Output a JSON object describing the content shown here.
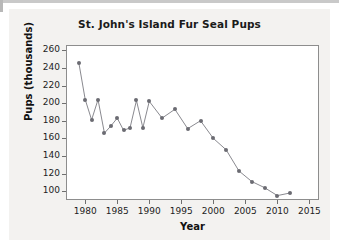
{
  "figure": {
    "background_color": "#f3f2f0",
    "plot_background_color": "#ffffff",
    "axis_color": "#8d8d8d",
    "series_color": "#6b6b72"
  },
  "chart_data": {
    "type": "line",
    "title": "St. John's Island Fur Seal Pups",
    "xlabel": "Year",
    "ylabel": "Pups (thousands)",
    "xlim": [
      1977,
      2016.5
    ],
    "ylim": [
      90,
      266
    ],
    "grid": false,
    "legend": null,
    "xticks": [
      1980,
      1985,
      1990,
      1995,
      2000,
      2005,
      2010,
      2015
    ],
    "xtick_labels": [
      "1980",
      "1985",
      "1990",
      "1995",
      "2000",
      "2005",
      "2010",
      "2015"
    ],
    "yticks": [
      100,
      120,
      140,
      160,
      180,
      200,
      220,
      240,
      260
    ],
    "ytick_labels": [
      "100",
      "120",
      "140",
      "160",
      "180",
      "200",
      "220",
      "240",
      "260"
    ],
    "marker": "circle",
    "x": [
      1979,
      1980,
      1981,
      1982,
      1983,
      1984,
      1985,
      1986,
      1987,
      1988,
      1989,
      1990,
      1992,
      1994,
      1996,
      1998,
      2000,
      2002,
      2004,
      2006,
      2008,
      2010,
      2012
    ],
    "values": [
      246,
      204,
      181,
      204,
      166,
      174,
      183,
      169,
      172,
      203,
      172,
      202,
      183,
      193,
      171,
      180,
      160,
      147,
      123,
      111,
      104,
      95,
      98
    ],
    "points": [
      {
        "year": 1979,
        "pups": 246
      },
      {
        "year": 1980,
        "pups": 204
      },
      {
        "year": 1981,
        "pups": 181
      },
      {
        "year": 1982,
        "pups": 204
      },
      {
        "year": 1983,
        "pups": 166
      },
      {
        "year": 1984,
        "pups": 174
      },
      {
        "year": 1985,
        "pups": 183
      },
      {
        "year": 1986,
        "pups": 169
      },
      {
        "year": 1987,
        "pups": 172
      },
      {
        "year": 1988,
        "pups": 203
      },
      {
        "year": 1989,
        "pups": 172
      },
      {
        "year": 1990,
        "pups": 202
      },
      {
        "year": 1992,
        "pups": 183
      },
      {
        "year": 1994,
        "pups": 193
      },
      {
        "year": 1996,
        "pups": 171
      },
      {
        "year": 1998,
        "pups": 180
      },
      {
        "year": 2000,
        "pups": 160
      },
      {
        "year": 2002,
        "pups": 147
      },
      {
        "year": 2004,
        "pups": 123
      },
      {
        "year": 2006,
        "pups": 111
      },
      {
        "year": 2008,
        "pups": 104
      },
      {
        "year": 2010,
        "pups": 95
      },
      {
        "year": 2012,
        "pups": 98
      }
    ]
  }
}
